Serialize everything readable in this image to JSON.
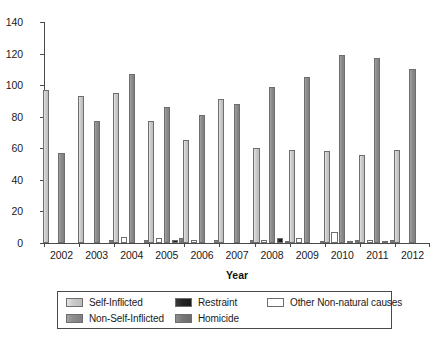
{
  "chart_data": {
    "type": "bar",
    "title": "",
    "xlabel": "Year",
    "ylabel": "",
    "ylim": [
      0,
      140
    ],
    "yticks": [
      0,
      20,
      40,
      60,
      80,
      100,
      120,
      140
    ],
    "grid": false,
    "legend_position": "bottom",
    "categories": [
      "2002",
      "2003",
      "2004",
      "2005",
      "2006",
      "2007",
      "2008",
      "2009",
      "2010",
      "2011",
      "2012"
    ],
    "series": [
      {
        "name": "Self-Inflicted",
        "color": "#c9c9c9",
        "values": [
          97,
          93,
          95,
          77,
          65,
          91,
          60,
          59,
          58,
          56,
          59
        ]
      },
      {
        "name": "Other Non-natural causes",
        "color": "#ffffff",
        "values": [
          0,
          0,
          4,
          3,
          2,
          0,
          2,
          3,
          7,
          2,
          0
        ]
      },
      {
        "name": "Non-Self-Inflicted",
        "color": "#8b8b8b",
        "values": [
          57,
          77,
          107,
          86,
          81,
          88,
          99,
          105,
          119,
          117,
          110
        ]
      },
      {
        "name": "Restraint",
        "color": "#222222",
        "values": [
          0,
          0,
          0,
          2,
          0,
          0,
          3,
          0,
          1,
          1,
          0
        ]
      },
      {
        "name": "Homicide",
        "color": "#767676",
        "values": [
          0,
          2,
          2,
          3,
          2,
          2,
          1,
          1,
          2,
          2,
          0
        ]
      }
    ]
  },
  "axis": {
    "x_title": "Year",
    "y_tick_labels": [
      "0",
      "20",
      "40",
      "60",
      "80",
      "100",
      "120",
      "140"
    ],
    "x_tick_labels": [
      "2002",
      "2003",
      "2004",
      "2005",
      "2006",
      "2007",
      "2008",
      "2009",
      "2010",
      "2011",
      "2012"
    ]
  },
  "legend": {
    "items": [
      {
        "label": "Self-Inflicted",
        "swatch": "s-self"
      },
      {
        "label": "Non-Self-Inflicted",
        "swatch": "s-nonself"
      },
      {
        "label": "Restraint",
        "swatch": "s-restraint"
      },
      {
        "label": "Homicide",
        "swatch": "s-homicide"
      },
      {
        "label": "Other Non-natural causes",
        "swatch": "s-other"
      }
    ]
  }
}
